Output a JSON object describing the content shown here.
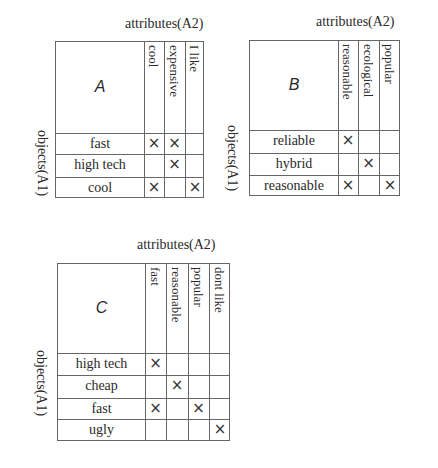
{
  "contexts": [
    {
      "name": "A",
      "attributes_label": "attributes(A2)",
      "objects_label": "objects(A1)",
      "attributes": [
        "cool",
        "expensive",
        "I like"
      ],
      "objects": [
        "fast",
        "high tech",
        "cool"
      ],
      "incidence": [
        [
          true,
          true,
          false
        ],
        [
          false,
          true,
          false
        ],
        [
          true,
          false,
          true
        ]
      ]
    },
    {
      "name": "B",
      "attributes_label": "attributes(A2)",
      "objects_label": "objects(A1)",
      "attributes": [
        "reasonable",
        "ecological",
        "popular"
      ],
      "objects": [
        "reliable",
        "hybrid",
        "reasonable"
      ],
      "incidence": [
        [
          true,
          false,
          false
        ],
        [
          false,
          true,
          false
        ],
        [
          true,
          false,
          true
        ]
      ]
    },
    {
      "name": "C",
      "attributes_label": "attributes(A2)",
      "objects_label": "objects(A1)",
      "attributes": [
        "fast",
        "reasonable",
        "popular",
        "dont like"
      ],
      "objects": [
        "high tech",
        "cheap",
        "fast",
        "ugly"
      ],
      "incidence": [
        [
          true,
          false,
          false,
          false
        ],
        [
          false,
          true,
          false,
          false
        ],
        [
          true,
          false,
          true,
          false
        ],
        [
          false,
          false,
          false,
          true
        ]
      ]
    }
  ],
  "cross_symbol": "×"
}
